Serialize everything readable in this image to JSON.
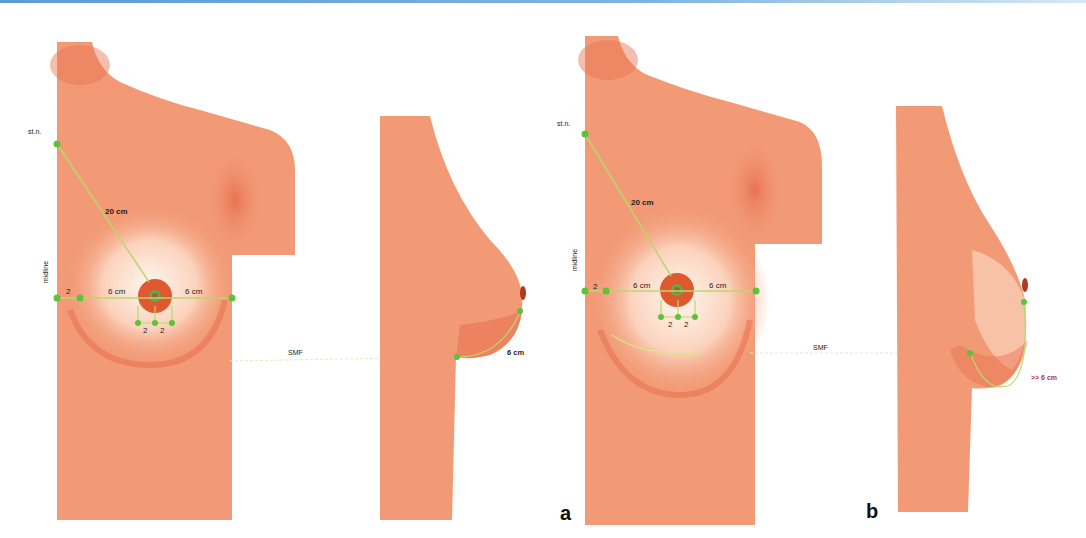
{
  "figure": {
    "top_rule_color": "#5b9bd5",
    "skin_color": "#f29a76",
    "skin_shadow_color": "#e8704f",
    "areola_color": "#e0582f",
    "marker_color": "#5cc23a",
    "guide_line_color": "#b8d86a",
    "panels": [
      {
        "letter": "a",
        "front_view": {
          "label_sternal_notch": "st.n.",
          "label_midline": "midline",
          "label_sn_to_nipple": "20 cm",
          "label_left_width": "6 cm",
          "label_right_width": "6 cm",
          "label_midline_offset": "2",
          "label_below_left": "2",
          "label_below_right": "2"
        },
        "label_smf": "SMF",
        "side_view": {
          "label_nipple_to_fold": "6 cm"
        }
      },
      {
        "letter": "b",
        "front_view": {
          "label_sternal_notch": "st.n.",
          "label_midline": "midline",
          "label_sn_to_nipple": "20 cm",
          "label_left_width": "6 cm",
          "label_right_width": "6 cm",
          "label_midline_offset": "2",
          "label_below_left": "2",
          "label_below_right": "2"
        },
        "label_smf": "SMF",
        "side_view": {
          "label_nipple_to_fold": ">> 6 cm"
        }
      }
    ]
  }
}
